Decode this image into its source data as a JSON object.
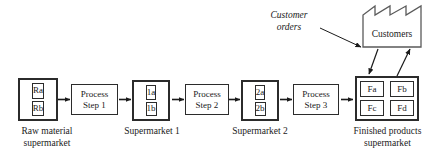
{
  "diagram": {
    "colors": {
      "stroke": "#2b2b2b",
      "background": "#ffffff",
      "text": "#1a1a1a"
    },
    "raw_material_supermarket": {
      "caption": "Raw material\nsupermarket",
      "cells": [
        "Ra",
        "Rb"
      ]
    },
    "supermarket_1": {
      "caption": "Supermarket 1",
      "cells": [
        "1a",
        "1b"
      ]
    },
    "supermarket_2": {
      "caption": "Supermarket 2",
      "cells": [
        "2a",
        "2b"
      ]
    },
    "finished_products_supermarket": {
      "caption": "Finished products\nsupermarket",
      "cells": [
        "Fa",
        "Fb",
        "Fc",
        "Fd"
      ]
    },
    "processes": [
      {
        "line1": "Process",
        "line2": "Step 1"
      },
      {
        "line1": "Process",
        "line2": "Step 2"
      },
      {
        "line1": "Process",
        "line2": "Step 3"
      }
    ],
    "customers": {
      "label": "Customers",
      "shape": "factory-sawtooth-roof"
    },
    "annotation": {
      "text": "Customer\norders"
    },
    "flow_arrows": {
      "count": 6,
      "direction": "left-to-right"
    },
    "customer_arrows": {
      "orders_in": "diagonal arrow from Customer orders label to Customers factory",
      "demand_down": "diagonal arrow from Customers down to Finished products supermarket",
      "shipment_up": "diagonal arrow from Finished products supermarket up to Customers"
    }
  }
}
